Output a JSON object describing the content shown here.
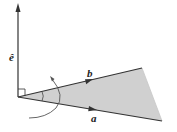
{
  "diagram": {
    "labels": {
      "e_hat": "ê",
      "b": "b",
      "a": "a"
    },
    "colors": {
      "line": "#333333",
      "fill": "#d0d0d0",
      "arc": "#555555"
    }
  }
}
